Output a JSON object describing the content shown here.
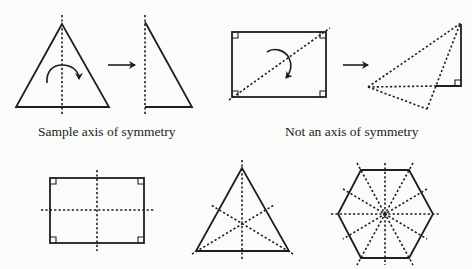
{
  "captions": {
    "sample": "Sample axis of symmetry",
    "not_axis": "Not an axis of symmetry"
  },
  "colors": {
    "background": "#fbfbfa",
    "line": "#1e1e1e"
  },
  "figures": [
    {
      "id": "isosceles-triangle",
      "axes": 1,
      "description": "Isosceles triangle with vertical axis and curved fold arrow"
    },
    {
      "id": "half-triangle",
      "description": "Result of folding triangle along axis: right triangle"
    },
    {
      "id": "rectangle-diagonal",
      "description": "Rectangle with diagonal (not a symmetry axis) and curved fold arrow"
    },
    {
      "id": "folded-rectangle",
      "description": "Result of folding rectangle along diagonal; halves do not match"
    },
    {
      "id": "rectangle-two-axes",
      "axes": 2
    },
    {
      "id": "equilateral-triangle-three-axes",
      "axes": 3
    },
    {
      "id": "regular-hexagon-six-axes",
      "axes": 6
    }
  ],
  "icons": {
    "fold_arrow": "curved-arrow-icon",
    "transform_arrow": "right-arrow-icon"
  }
}
